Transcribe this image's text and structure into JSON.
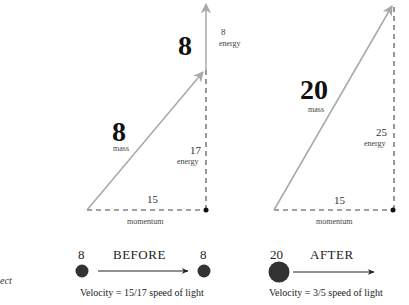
{
  "colors": {
    "vector_gray": "#a8a8a8",
    "dashed_line": "#444444",
    "particle": "#333333",
    "text": "#1a1a1a"
  },
  "edge_text": "ect",
  "before": {
    "triangle": {
      "hypotenuse_value": "8",
      "hypotenuse_label": "mass",
      "vertical_value": "17",
      "vertical_label": "energy",
      "base_value": "15",
      "base_label": "momentum"
    },
    "extra_vector": {
      "value": "8",
      "label": "energy",
      "big_value": "8"
    },
    "particles": {
      "left_mass": "8",
      "right_mass": "8",
      "title": "BEFORE",
      "velocity": "Velocity = 15/17 speed of light"
    }
  },
  "after": {
    "triangle": {
      "hypotenuse_value": "20",
      "hypotenuse_label": "mass",
      "vertical_value": "25",
      "vertical_label": "energy",
      "base_value": "15",
      "base_label": "momentum"
    },
    "particles": {
      "mass": "20",
      "title": "AFTER",
      "velocity": "Velocity = 3/5 speed of light"
    }
  }
}
